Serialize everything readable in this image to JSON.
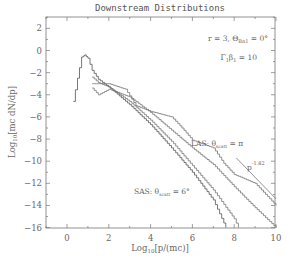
{
  "chart_data": {
    "type": "line",
    "title": "Downstream Distributions",
    "xlabel": "Log10[p/(mc)]",
    "ylabel": "Log10[mc dN/dp]",
    "xlim": [
      -1,
      10
    ],
    "ylim": [
      -16,
      3
    ],
    "x_ticks": [
      0,
      2,
      4,
      6,
      8,
      10
    ],
    "y_ticks": [
      2,
      0,
      -2,
      -4,
      -6,
      -8,
      -10,
      -12,
      -14,
      -16
    ],
    "grid": false,
    "legend": null,
    "annotations": [
      {
        "text": "r = 3,  Θ_Bn1 = 0°",
        "x": 7.5,
        "y": 1.5
      },
      {
        "text": "Γ1β1 = 10",
        "x": 8.2,
        "y": -0.3
      },
      {
        "text": "LAS: θ_scatt = π",
        "x": 6.8,
        "y": -6.8
      },
      {
        "text": "SAS: θ_scatt = 6°",
        "x": 3.4,
        "y": -12.6
      },
      {
        "text": "p^-1.82",
        "x": 8.9,
        "y": -9.6
      }
    ],
    "series": [
      {
        "name": "SAS θ_scatt = 6° (steepest)",
        "style": "histogram",
        "x": [
          0.3,
          0.5,
          0.7,
          0.85,
          1.0,
          1.2,
          1.5,
          2,
          3,
          4,
          5,
          6,
          7,
          7.6
        ],
        "y": [
          -4.6,
          -2.5,
          -0.6,
          -0.4,
          -0.7,
          -1.8,
          -2.6,
          -3.3,
          -4.9,
          -6.7,
          -8.8,
          -11.0,
          -13.5,
          -16
        ]
      },
      {
        "name": "intermediate 1",
        "style": "histogram",
        "x": [
          1.2,
          1.5,
          2,
          3,
          4,
          5,
          6,
          7,
          8,
          8.2
        ],
        "y": [
          -2.4,
          -2.9,
          -3.3,
          -4.6,
          -6.3,
          -8.2,
          -10.4,
          -12.6,
          -15.2,
          -16
        ]
      },
      {
        "name": "intermediate 2",
        "style": "histogram",
        "x": [
          1.2,
          1.5,
          2,
          3,
          4,
          5,
          6,
          7,
          8,
          9,
          10
        ],
        "y": [
          -3.4,
          -4.0,
          -3.5,
          -4.2,
          -5.6,
          -7.2,
          -8.8,
          -10.3,
          -12.3,
          -14.2,
          -16
        ]
      },
      {
        "name": "LAS θ_scatt = π",
        "style": "histogram",
        "x": [
          1.2,
          2,
          2.8,
          3.3,
          4,
          5,
          5.5,
          6,
          7,
          7.5,
          8,
          9,
          10
        ],
        "y": [
          -3.0,
          -3.0,
          -3.5,
          -5.0,
          -5.5,
          -6.0,
          -7.0,
          -8.1,
          -8.8,
          -10.2,
          -11.2,
          -12.0,
          -14.0
        ]
      },
      {
        "name": "p^-1.82 reference",
        "style": "line",
        "x": [
          8.1,
          10
        ],
        "y": [
          -9.7,
          -13.4
        ]
      }
    ]
  },
  "labels": {
    "title": "Downstream Distributions",
    "xlabel_main": "Log",
    "xlabel_sub": "10",
    "xlabel_rest": "[p/(mc)]",
    "ylabel_main": "Log",
    "ylabel_sub": "10",
    "ylabel_rest": "[mc dN/dp]",
    "ann1": "r = 3,  Θ",
    "ann1_sub": "Bn1",
    "ann1_rest": " = 0°",
    "ann2": "Γ",
    "ann2_sub": "1",
    "ann2_mid": "β",
    "ann2_sub2": "1",
    "ann2_rest": " = 10",
    "las": "LAS:  θ",
    "las_sub": "scatt",
    "las_rest": " = π",
    "sas": "SAS:  θ",
    "sas_sub": "scatt",
    "sas_rest": " = 6°",
    "pow": "p",
    "pow_sup": "-1.82"
  }
}
